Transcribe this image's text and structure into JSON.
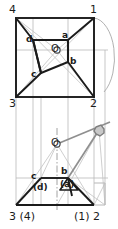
{
  "drawing": {
    "title": "Orthographic projection of a pyramid: top view and front view",
    "type": "descriptive-geometry-projection",
    "views": [
      "top-view",
      "front-view"
    ],
    "colors": {
      "outline": "#1b1b1b",
      "construction": "#9a9a9a",
      "construction_light": "#bdbdbd",
      "node_fill": "#b0b0b0",
      "background": "#ffffff"
    }
  },
  "top_view": {
    "corner_labels": {
      "top_left": "4",
      "top_right": "1",
      "bottom_left": "3",
      "bottom_right": "2"
    },
    "point_labels": {
      "d": "d",
      "a": "a",
      "b": "b",
      "c": "c",
      "o": "O"
    }
  },
  "front_view": {
    "corner_labels": {
      "bottom_left": "3 (4)",
      "bottom_right": "(1) 2"
    },
    "point_labels": {
      "c": "c",
      "d": "(d)",
      "b": "b",
      "a": "(a)",
      "o": "O"
    }
  }
}
